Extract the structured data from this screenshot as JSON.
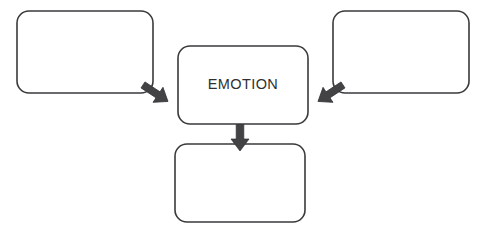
{
  "diagram": {
    "type": "flow-diagram",
    "background_color": "#ffffff",
    "box_stroke_color": "#3a3a3c",
    "box_fill_color": "#ffffff",
    "arrow_color": "#434346",
    "text_color": "#2f2f31",
    "nodes": [
      {
        "id": "left-box",
        "label": "",
        "position": "top-left",
        "x": 17,
        "y": 11,
        "width": 136,
        "height": 82,
        "filled": false
      },
      {
        "id": "center-box",
        "label": "EMOTION",
        "position": "center",
        "x": 178,
        "y": 46,
        "width": 130,
        "height": 78,
        "filled": false
      },
      {
        "id": "right-box",
        "label": "",
        "position": "top-right",
        "x": 333,
        "y": 11,
        "width": 136,
        "height": 82,
        "filled": false
      },
      {
        "id": "bottom-box",
        "label": "",
        "position": "bottom-center",
        "x": 175,
        "y": 144,
        "width": 130,
        "height": 78,
        "filled": false
      }
    ],
    "arrows": [
      {
        "id": "arrow-left-to-center",
        "from": "left-box",
        "to": "center-box",
        "direction": "down-right"
      },
      {
        "id": "arrow-right-to-center",
        "from": "right-box",
        "to": "center-box",
        "direction": "down-left"
      },
      {
        "id": "arrow-center-to-bottom",
        "from": "center-box",
        "to": "bottom-box",
        "direction": "down"
      }
    ]
  }
}
